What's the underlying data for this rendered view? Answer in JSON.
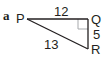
{
  "part_label": "a",
  "triangle": {
    "vertices": {
      "P": "P",
      "Q": "Q",
      "R": "R"
    },
    "sides": {
      "PQ": "12",
      "QR": "5",
      "PR": "13"
    },
    "right_angle_at": "Q"
  },
  "colors": {
    "line": "#231f20",
    "right_angle_marker": "#a7a9ac"
  }
}
